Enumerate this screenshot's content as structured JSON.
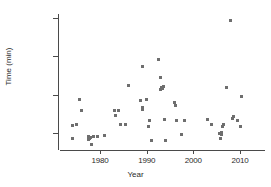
{
  "chart_data": {
    "type": "scatter",
    "title": "",
    "xlabel": "Year",
    "ylabel": "Time (min)",
    "xlim": [
      1973,
      2011
    ],
    "ylim": [
      820,
      2560
    ],
    "xticks": [
      1980,
      1990,
      2000,
      2010
    ],
    "yticks": [
      1000,
      1500,
      2000,
      2500
    ],
    "xtick_labels": [
      "1980",
      "1990",
      "2000",
      "2010"
    ],
    "ytick_labels": [
      "1000",
      "1500",
      "2000",
      "2500"
    ],
    "grid": false,
    "legend": null,
    "marker_color": "#6e6e6e",
    "axis_color": "#4a4a4a",
    "series": [
      {
        "name": "observations",
        "x": [
          1974,
          1974,
          1975,
          1975.5,
          1976,
          1977.6,
          1977.6,
          1977.8,
          1978,
          1978.2,
          1978.6,
          1979.4,
          1981,
          1983,
          1983.4,
          1984,
          1984.4,
          1985.4,
          1986,
          1988.6,
          1989,
          1989,
          1989.2,
          1990,
          1990.4,
          1990.6,
          1991,
          1992.6,
          1993,
          1993,
          1993.2,
          1993.4,
          1993.6,
          1993.8,
          1994,
          1996,
          1996.2,
          1996.4,
          1997.4,
          1998,
          2003,
          2003.8,
          2005.6,
          2005.8,
          2006,
          2006,
          2006.2,
          2006.4,
          2007,
          2008,
          2008.4,
          2008.6,
          2009.4,
          2010,
          2010.4
        ],
        "y": [
          1100,
          925,
          1115,
          1435,
          1290,
          955,
          920,
          925,
          940,
          855,
          955,
          955,
          965,
          1290,
          1225,
          1290,
          1110,
          1110,
          1620,
          1425,
          1330,
          1305,
          1865,
          1440,
          1080,
          1165,
          900,
          1960,
          1730,
          1570,
          1600,
          1580,
          1605,
          1170,
          900,
          1400,
          1365,
          1165,
          985,
          1165,
          1175,
          1115,
          990,
          930,
          1005,
          985,
          1090,
          1110,
          1600,
          2470,
          1195,
          1215,
          1160,
          1090,
          1470
        ]
      }
    ]
  },
  "axis": {
    "y_title": "Time (min)",
    "x_title": "Year"
  }
}
